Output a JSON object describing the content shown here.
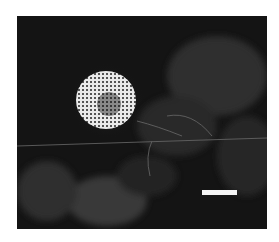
{
  "image": {
    "type": "fluorescence micrograph",
    "description": "Dark field with a bright circular granular cell cluster on the left and faint filamentous network; white scale bar bottom-right",
    "colors": {
      "background": "#141414",
      "cluster": "#f0f0f0",
      "scale_bar": "#f4f4f4",
      "page": "#ffffff"
    }
  }
}
